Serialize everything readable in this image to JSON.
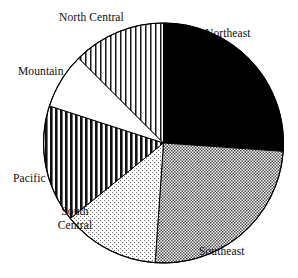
{
  "figure": {
    "background_color": "#ffffff",
    "outline_color": "#000000"
  },
  "chart_data": {
    "type": "pie",
    "title": "",
    "subtitle": "",
    "xlabel": "",
    "ylabel": "",
    "legend_position": "none",
    "grid": false,
    "labels_position": "outside",
    "start_angle_deg": 0,
    "direction": "clockwise",
    "center_px": [
      163.5,
      143
    ],
    "radius_px": 120,
    "categories": [
      "Northeast",
      "Southeast",
      "South Central",
      "Pacific",
      "Mountain",
      "North Central"
    ],
    "values": [
      26.1,
      25.0,
      13.1,
      15.8,
      7.5,
      12.5
    ],
    "unit": "percent",
    "slices": [
      {
        "label": "Northeast",
        "value": 26.1,
        "start_angle_deg": 0,
        "end_angle_deg": 94,
        "fill_style": "solid-black",
        "fill_color": "#000000",
        "label_line_1": "Northeast",
        "label_line_2": ""
      },
      {
        "label": "Southeast",
        "value": 25.0,
        "start_angle_deg": 94,
        "end_angle_deg": 184,
        "fill_style": "fine-crosshatch-gray",
        "fill_color": "#9a9a9a",
        "label_line_1": "Southeast",
        "label_line_2": ""
      },
      {
        "label": "South Central",
        "value": 13.1,
        "start_angle_deg": 184,
        "end_angle_deg": 231,
        "fill_style": "light-diagonal-hatch",
        "fill_color": "#cfcfcf",
        "label_line_1": "South",
        "label_line_2": "Central"
      },
      {
        "label": "Pacific",
        "value": 15.8,
        "start_angle_deg": 231,
        "end_angle_deg": 288,
        "fill_style": "bold-vertical-stripes",
        "fill_color": "#303030",
        "label_line_1": "Pacific",
        "label_line_2": ""
      },
      {
        "label": "Mountain",
        "value": 7.5,
        "start_angle_deg": 288,
        "end_angle_deg": 315,
        "fill_style": "blank-white",
        "fill_color": "#ffffff",
        "label_line_1": "Mountain",
        "label_line_2": ""
      },
      {
        "label": "North Central",
        "value": 12.5,
        "start_angle_deg": 315,
        "end_angle_deg": 360,
        "fill_style": "thin-vertical-stripes",
        "fill_color": "#555555",
        "label_line_1": "North Central",
        "label_line_2": ""
      }
    ]
  }
}
